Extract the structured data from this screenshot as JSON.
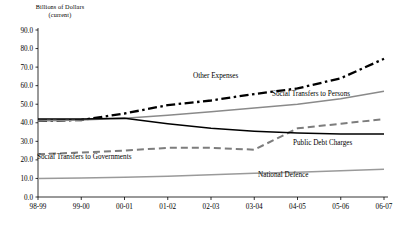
{
  "chart_data": {
    "type": "line",
    "title": "",
    "ylabel_line1": "Billions of Dollars",
    "ylabel_line2": "(current)",
    "xlabel": "",
    "ylim": [
      0,
      90
    ],
    "grid": false,
    "legend_position": "inline-annotations",
    "categories": [
      "98-99",
      "99-00",
      "00-01",
      "01-02",
      "02-03",
      "03-04",
      "04-05",
      "05-06",
      "06-07"
    ],
    "yticks": [
      "0.0",
      "10.0",
      "20.0",
      "30.0",
      "40.0",
      "50.0",
      "60.0",
      "70.0",
      "80.0",
      "90.0"
    ],
    "ytick_values": [
      0,
      10,
      20,
      30,
      40,
      50,
      60,
      70,
      80,
      90
    ],
    "series": [
      {
        "name": "Other Expenses",
        "style": "dash-dot",
        "color": "#000000",
        "values": [
          41.0,
          41.5,
          45.0,
          49.5,
          52.0,
          55.5,
          58.5,
          64.0,
          74.5
        ],
        "label_x": "01-02",
        "label_text": "Other Expenses"
      },
      {
        "name": "Social Transfers to Persons",
        "style": "solid",
        "color": "#8a8a8a",
        "values": [
          41.0,
          41.5,
          42.5,
          44.0,
          46.0,
          48.0,
          50.0,
          53.0,
          57.0
        ],
        "label_x": "03-04",
        "label_text": "Social Transfers to Persons"
      },
      {
        "name": "Social Transfers to Governments",
        "style": "dashed",
        "color": "#7d7d7d",
        "values": [
          23.0,
          24.0,
          25.0,
          26.5,
          26.5,
          25.5,
          37.0,
          39.5,
          42.0
        ],
        "label_x": "98-99",
        "label_text": "Social Transfers to Governments"
      },
      {
        "name": "Public Debt Charges",
        "style": "solid",
        "color": "#000000",
        "values": [
          42.0,
          42.0,
          42.5,
          39.5,
          37.0,
          35.5,
          34.5,
          34.0,
          34.0
        ],
        "label_x": "04-05",
        "label_text": "Public Debt Charges"
      },
      {
        "name": "National Defence",
        "style": "solid",
        "color": "#9a9a9a",
        "values": [
          10.0,
          10.2,
          10.6,
          11.2,
          12.0,
          12.8,
          13.4,
          14.2,
          15.0
        ],
        "label_x": "03-04",
        "label_text": "National Defence"
      }
    ]
  },
  "axis": {
    "y_title_line1": "Billions of Dollars",
    "y_title_line2": "(current)"
  }
}
